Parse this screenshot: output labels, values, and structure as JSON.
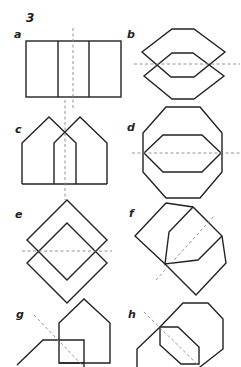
{
  "figure_number": "3",
  "panels": [
    {
      "id": "a",
      "label": "a",
      "description": "rectangle divided by two vertical lines, vertical dashed axis"
    },
    {
      "id": "b",
      "label": "b",
      "description": "two overlapping hexagons, horizontal dashed axis"
    },
    {
      "id": "c",
      "label": "c",
      "description": "two overlapping pentagon house shapes, vertical dashed axis"
    },
    {
      "id": "d",
      "label": "d",
      "description": "octagon with inner hexagon, horizontal dashed axis"
    },
    {
      "id": "e",
      "label": "e",
      "description": "two overlapping squares rotated 45 degrees, horizontal dashed axis"
    },
    {
      "id": "f",
      "label": "f",
      "description": "two overlapping irregular polygons, diagonal dashed axis"
    },
    {
      "id": "g",
      "label": "g",
      "description": "house shape overlapping square and partial shape, diagonal dashed axis"
    },
    {
      "id": "h",
      "label": "h",
      "description": "octagon overlapping smaller octagon, diagonal dashed axis"
    }
  ],
  "colors": {
    "stroke": "#222222",
    "axis": "#888888",
    "background": "#ffffff"
  }
}
